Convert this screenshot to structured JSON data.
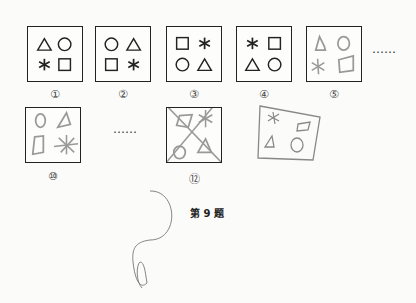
{
  "figure": {
    "caption": "第 9 题",
    "ellipsis": "……",
    "panels": [
      {
        "label": "①",
        "shapes": [
          "triangle",
          "circle",
          "asterisk",
          "square"
        ],
        "style": "printed"
      },
      {
        "label": "②",
        "shapes": [
          "circle",
          "triangle",
          "square",
          "asterisk"
        ],
        "style": "printed"
      },
      {
        "label": "③",
        "shapes": [
          "square",
          "asterisk",
          "circle",
          "triangle"
        ],
        "style": "printed"
      },
      {
        "label": "④",
        "shapes": [
          "asterisk",
          "square",
          "triangle",
          "circle"
        ],
        "style": "printed"
      },
      {
        "label": "⑤",
        "shapes": [
          "triangle",
          "circle",
          "asterisk",
          "square"
        ],
        "style": "handwritten"
      },
      {
        "label": "⑩",
        "shapes": [
          "circle",
          "triangle",
          "square",
          "asterisk"
        ],
        "style": "handwritten"
      },
      {
        "label": "⑫",
        "shapes": [
          "square",
          "asterisk",
          "circle",
          "triangle"
        ],
        "style": "handwritten-crossed-out"
      },
      {
        "label": "",
        "shapes": [
          "asterisk",
          "square",
          "triangle",
          "circle"
        ],
        "style": "handwritten-answer"
      }
    ]
  },
  "colors": {
    "ink": "#222222",
    "pencil": "#9a9a9a",
    "paper": "#fbfbfa"
  }
}
